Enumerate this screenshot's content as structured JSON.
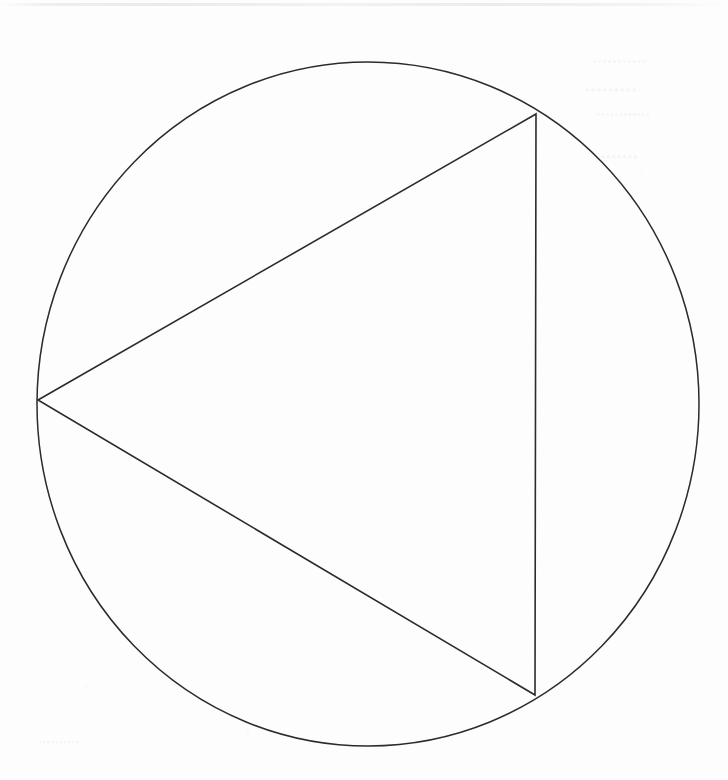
{
  "page": {
    "width": 728,
    "height": 780,
    "background_color": "#fdfdfd",
    "medium": "scanned-line-drawing",
    "ink_color": "#2b2b2b"
  },
  "figure": {
    "name": "equilateral-triangle-inscribed-in-circle",
    "stroke_color": "#2b2b2b",
    "fill": "none",
    "circle": {
      "label": "circumscribed-circle",
      "center_x": 368,
      "center_y": 404,
      "radius_x": 331,
      "radius_y": 342,
      "stroke_width": 1.5
    },
    "triangle": {
      "label": "inscribed-equilateral-triangle",
      "stroke_width": 1.6,
      "vertices": [
        {
          "name": "left-vertex",
          "x": 38,
          "y": 400
        },
        {
          "name": "top-right-vertex",
          "x": 536,
          "y": 114
        },
        {
          "name": "bottom-right-vertex",
          "x": 535,
          "y": 695
        }
      ],
      "edges": [
        {
          "name": "upper-left-edge",
          "from": "left-vertex",
          "to": "top-right-vertex"
        },
        {
          "name": "right-edge",
          "from": "top-right-vertex",
          "to": "bottom-right-vertex"
        },
        {
          "name": "lower-left-edge",
          "from": "bottom-right-vertex",
          "to": "left-vertex"
        }
      ]
    }
  },
  "artifacts": {
    "scan_edge_band": {
      "label": "faint horizontal gray band along top edge",
      "top": 3,
      "height": 3
    },
    "bleed_through": {
      "label": "illegible mirrored ghost text bleeding through from reverse side of the page",
      "legible": false,
      "lines": [
        "•••••••••••",
        "•••••••••",
        "••••••••••••",
        "•••••••",
        "••••••••••"
      ]
    }
  }
}
